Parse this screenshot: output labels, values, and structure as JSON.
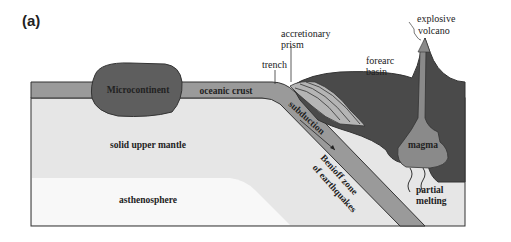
{
  "figure": {
    "panel_label": "(a)",
    "colors": {
      "mantle": "#e6e6e6",
      "asthenosphere": "#f7f7f7",
      "oceanic_crust": "#9a9a9a",
      "microcontinent": "#5e5e5e",
      "continental_crust": "#4a4a4a",
      "accretionary_prism": "#b5b5b5",
      "magma": "#8a8a8a",
      "outline": "#333333"
    },
    "labels": {
      "microcontinent": "Microcontinent",
      "oceanic_crust": "oceanic crust",
      "trench": "trench",
      "accretionary_prism_1": "accretionary",
      "accretionary_prism_2": "prism",
      "forearc_basin_1": "forearc",
      "forearc_basin_2": "basin",
      "explosive_volcano_1": "explosive",
      "explosive_volcano_2": "volcano",
      "subduction": "subduction",
      "benioff_1": "Benioff zone",
      "benioff_2": "of earthquakes",
      "magma": "magma",
      "partial_melting_1": "partial",
      "partial_melting_2": "melting",
      "solid_upper_mantle": "solid upper mantle",
      "asthenosphere": "asthenosphere"
    }
  }
}
